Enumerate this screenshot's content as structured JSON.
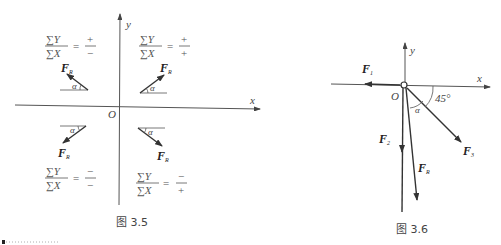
{
  "figure_3_5": {
    "caption": "图 3.5",
    "axis_x": "x",
    "axis_y": "y",
    "origin": "O",
    "angle": "α",
    "sum_y": "∑Y",
    "sum_x": "∑X",
    "equals": "=",
    "quadrants": [
      {
        "name": "second",
        "force": "F",
        "sub": "R",
        "num_sign": "+",
        "den_sign": "−"
      },
      {
        "name": "first",
        "force": "F",
        "sub": "R",
        "num_sign": "+",
        "den_sign": "+"
      },
      {
        "name": "third",
        "force": "F",
        "sub": "R",
        "num_sign": "−",
        "den_sign": "−"
      },
      {
        "name": "fourth",
        "force": "F",
        "sub": "R",
        "num_sign": "−",
        "den_sign": "+"
      }
    ]
  },
  "figure_3_6": {
    "caption": "图 3.6",
    "axis_x": "x",
    "axis_y": "y",
    "origin": "O",
    "angle_alpha": "α",
    "angle_45": "45°",
    "forces": [
      {
        "name": "F",
        "sub": "1"
      },
      {
        "name": "F",
        "sub": "2"
      },
      {
        "name": "F",
        "sub": "3"
      },
      {
        "name": "F",
        "sub": "R"
      }
    ]
  }
}
